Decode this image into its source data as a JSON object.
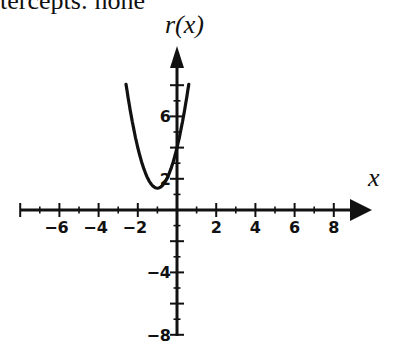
{
  "caption": "tercepts: none",
  "chart_data": {
    "type": "line",
    "title": "",
    "xlabel": "x",
    "ylabel": "r(x)",
    "x_ticks": [
      -6,
      -4,
      -2,
      2,
      4,
      6,
      8
    ],
    "y_ticks": [
      6,
      2,
      -4,
      -8
    ],
    "xlim": [
      -8,
      9
    ],
    "ylim": [
      -8,
      9
    ],
    "grid": false,
    "legend": null,
    "series": [
      {
        "name": "r(x)",
        "description": "upward-opening parabola, vertex near (-1, 1.4), y-intercept near 4, no x-intercepts",
        "x": [
          -2.6,
          -2.2,
          -1.8,
          -1.4,
          -1.0,
          -0.6,
          -0.2,
          0.0,
          0.2,
          0.6
        ],
        "y": [
          8.1,
          5.1,
          3.1,
          1.8,
          1.4,
          1.8,
          3.1,
          4.0,
          5.1,
          8.1
        ]
      }
    ]
  }
}
